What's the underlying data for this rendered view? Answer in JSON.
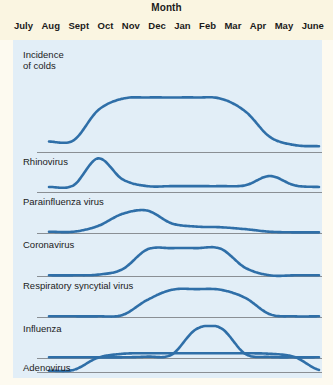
{
  "header": {
    "axis_title": "Month",
    "months": [
      "July",
      "Aug",
      "Sept",
      "Oct",
      "Nov",
      "Dec",
      "Jan",
      "Feb",
      "Mar",
      "Apr",
      "May",
      "June"
    ]
  },
  "colors": {
    "header_background": "#faf5e1",
    "plot_background": "#e2eef7",
    "curve": "#2f6fa8",
    "baseline": "#8a8f94",
    "text": "#1b1b1b"
  },
  "panels": [
    {
      "label": "Incidence\nof colds"
    },
    {
      "label": "Rhinovirus"
    },
    {
      "label": "Parainfluenza virus"
    },
    {
      "label": "Coronavirus"
    },
    {
      "label": "Respiratory syncytial virus"
    },
    {
      "label": "Influenza"
    },
    {
      "label": "Adenovirus"
    }
  ],
  "chart_data": {
    "type": "line",
    "xlabel": "Month",
    "ylabel": "",
    "grid": false,
    "legend": "none",
    "x": [
      "July",
      "Aug",
      "Sept",
      "Oct",
      "Nov",
      "Dec",
      "Jan",
      "Feb",
      "Mar",
      "Apr",
      "May",
      "June"
    ],
    "ylim": [
      0,
      1
    ],
    "series": [
      {
        "name": "Incidence of colds",
        "panel": 0,
        "values": [
          0.18,
          0.2,
          0.72,
          0.92,
          0.94,
          0.94,
          0.94,
          0.92,
          0.7,
          0.26,
          0.12,
          0.1
        ]
      },
      {
        "name": "Rhinovirus",
        "panel": 1,
        "values": [
          0.12,
          0.16,
          0.8,
          0.3,
          0.14,
          0.14,
          0.14,
          0.14,
          0.16,
          0.38,
          0.16,
          0.12
        ]
      },
      {
        "name": "Parainfluenza virus",
        "panel": 2,
        "values": [
          0.04,
          0.04,
          0.22,
          0.6,
          0.7,
          0.3,
          0.2,
          0.18,
          0.12,
          0.04,
          0.02,
          0.02
        ]
      },
      {
        "name": "Coronavirus",
        "panel": 3,
        "values": [
          0.02,
          0.02,
          0.04,
          0.2,
          0.78,
          0.82,
          0.82,
          0.8,
          0.24,
          0.02,
          0.02,
          0.02
        ]
      },
      {
        "name": "Respiratory syncytial virus",
        "panel": 4,
        "values": [
          0.02,
          0.02,
          0.02,
          0.06,
          0.5,
          0.8,
          0.82,
          0.8,
          0.56,
          0.08,
          0.02,
          0.02
        ]
      },
      {
        "name": "Influenza",
        "panel": 5,
        "values": [
          0.02,
          0.02,
          0.02,
          0.02,
          0.04,
          0.1,
          0.85,
          0.88,
          0.12,
          0.03,
          0.02,
          0.02
        ]
      },
      {
        "name": "Adenovirus",
        "panel": 6,
        "values": [
          0.05,
          0.08,
          0.55,
          0.7,
          0.72,
          0.72,
          0.72,
          0.72,
          0.72,
          0.7,
          0.58,
          0.08
        ]
      }
    ]
  }
}
